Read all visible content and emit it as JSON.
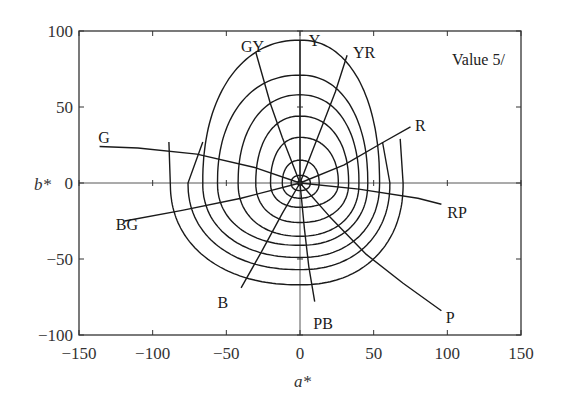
{
  "chart_data": {
    "type": "line",
    "title": "",
    "annotation": "Value 5/",
    "xlabel": "a*",
    "ylabel": "b*",
    "xlim": [
      -150,
      150
    ],
    "ylim": [
      -100,
      100
    ],
    "x_ticks": [
      -150,
      -100,
      -50,
      0,
      50,
      100,
      150
    ],
    "y_ticks": [
      -100,
      -50,
      0,
      50,
      100
    ],
    "x_tick_labels": [
      "−150",
      "−100",
      "−50",
      "0",
      "50",
      "100",
      "150"
    ],
    "y_tick_labels": [
      "−100",
      "−50",
      "0",
      "50",
      "100"
    ],
    "grid": false,
    "zero_lines": true,
    "chroma_contours": [
      {
        "a_left": -6,
        "a_right": 7,
        "b_top": 5,
        "b_bottom": -5
      },
      {
        "a_left": -12,
        "a_right": 13,
        "b_top": 15,
        "b_bottom": -10
      },
      {
        "a_left": -20,
        "a_right": 26,
        "b_top": 30,
        "b_bottom": -16
      },
      {
        "a_left": -30,
        "a_right": 33,
        "b_top": 44,
        "b_bottom": -26
      },
      {
        "a_left": -42,
        "a_right": 40,
        "b_top": 58,
        "b_bottom": -35
      },
      {
        "a_left": -56,
        "a_right": 46,
        "b_top": 71,
        "b_bottom": -41
      },
      {
        "a_left": -66,
        "a_right": 54,
        "b_top": 94,
        "b_bottom": -49
      },
      {
        "a_left": -76,
        "a_right": 61,
        "b_top": null,
        "b_bottom": -57,
        "open_from": [
          -66,
          27
        ],
        "open_to": [
          56,
          27
        ]
      },
      {
        "a_left": -88,
        "a_right": 70,
        "b_top": null,
        "b_bottom": -67,
        "open_from": [
          -89,
          27
        ],
        "open_to": [
          68,
          29
        ]
      }
    ],
    "hue_lines": [
      {
        "name": "Y",
        "points": [
          [
            0,
            0
          ],
          [
            0,
            94
          ]
        ],
        "label_at": [
          6,
          94
        ]
      },
      {
        "name": "YR",
        "points": [
          [
            0,
            0
          ],
          [
            8,
            20
          ],
          [
            16,
            40
          ],
          [
            24,
            60
          ],
          [
            32,
            84
          ]
        ],
        "label_at": [
          36,
          86
        ]
      },
      {
        "name": "R",
        "points": [
          [
            0,
            0
          ],
          [
            30,
            12
          ],
          [
            55,
            26
          ],
          [
            75,
            37
          ]
        ],
        "label_at": [
          78,
          38
        ]
      },
      {
        "name": "RP",
        "points": [
          [
            0,
            0
          ],
          [
            40,
            -4
          ],
          [
            80,
            -10
          ],
          [
            96,
            -14
          ]
        ],
        "label_at": [
          100,
          -19
        ]
      },
      {
        "name": "P",
        "points": [
          [
            0,
            0
          ],
          [
            20,
            -22
          ],
          [
            45,
            -47
          ],
          [
            70,
            -66
          ],
          [
            96,
            -84
          ]
        ],
        "label_at": [
          99,
          -88
        ]
      },
      {
        "name": "PB",
        "points": [
          [
            0,
            0
          ],
          [
            3,
            -30
          ],
          [
            6,
            -55
          ],
          [
            10,
            -78
          ]
        ],
        "label_at": [
          9,
          -92
        ]
      },
      {
        "name": "B",
        "points": [
          [
            0,
            0
          ],
          [
            -12,
            -20
          ],
          [
            -26,
            -45
          ],
          [
            -40,
            -69
          ]
        ],
        "label_at": [
          -56,
          -78
        ]
      },
      {
        "name": "BG",
        "points": [
          [
            0,
            0
          ],
          [
            -40,
            -10
          ],
          [
            -80,
            -18
          ],
          [
            -119,
            -25
          ]
        ],
        "label_at": [
          -125,
          -27
        ]
      },
      {
        "name": "G",
        "points": [
          [
            0,
            0
          ],
          [
            -30,
            10
          ],
          [
            -70,
            19
          ],
          [
            -110,
            23
          ],
          [
            -136,
            24
          ]
        ],
        "label_at": [
          -137,
          30
        ]
      },
      {
        "name": "GY",
        "points": [
          [
            0,
            0
          ],
          [
            -12,
            30
          ],
          [
            -20,
            52
          ],
          [
            -30,
            86
          ]
        ],
        "label_at": [
          -40,
          90
        ]
      }
    ],
    "legend": null
  }
}
